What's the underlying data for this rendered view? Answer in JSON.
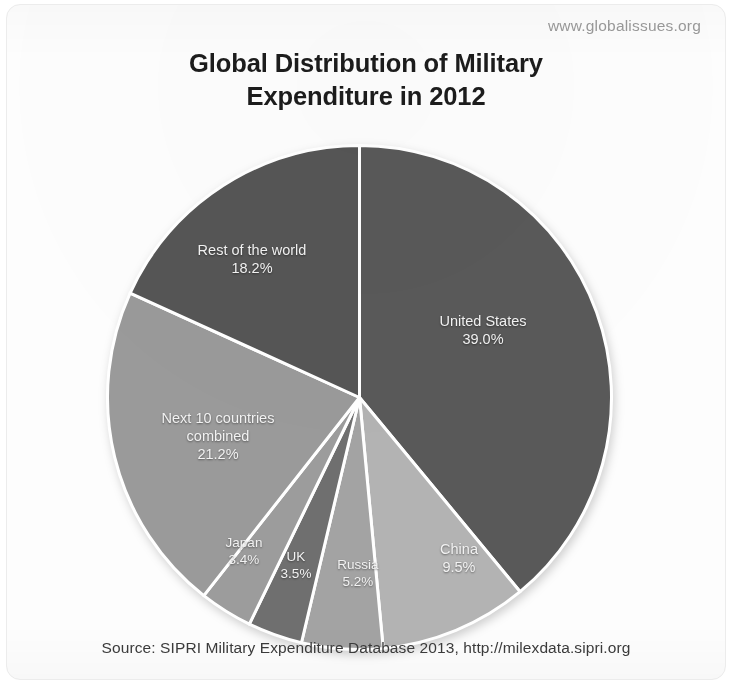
{
  "watermark_url": "www.globalissues.org",
  "title_lines": [
    "Global Distribution of Military",
    "Expenditure in 2012"
  ],
  "source_note": "Source: SIPRI Military Expenditure Database 2013, http://milexdata.sipri.org",
  "chart_data": {
    "type": "pie",
    "title": "Global Distribution of Military Expenditure in 2012",
    "subtitle": "",
    "xlabel": "",
    "ylabel": "",
    "unit": "%",
    "legend_position": "none",
    "labels_inside_slices": true,
    "start_angle_deg": 0,
    "direction": "clockwise",
    "categories": [
      "United States",
      "China",
      "Russia",
      "UK",
      "Japan",
      "Next 10 countries combined",
      "Rest of the world"
    ],
    "values": [
      39.0,
      9.5,
      5.2,
      3.5,
      3.4,
      21.2,
      18.2
    ],
    "value_labels": [
      "39.0%",
      "9.5%",
      "5.2%",
      "3.5%",
      "3.4%",
      "21.2%",
      "18.2%"
    ],
    "colors": [
      "#595959",
      "#b3b3b3",
      "#a3a3a3",
      "#6f6f6f",
      "#9c9c9c",
      "#9a9a9a",
      "#555555"
    ],
    "slices": [
      {
        "name": "United States",
        "value": 39.0,
        "value_label": "39.0%",
        "label_line1": "United States",
        "label_line2": "39.0%",
        "color": "#595959",
        "label_x": 377,
        "label_y": 186
      },
      {
        "name": "China",
        "value": 9.5,
        "value_label": "9.5%",
        "label_line1": "China",
        "label_line2": "9.5%",
        "color": "#b3b3b3",
        "label_x": 353,
        "label_y": 414
      },
      {
        "name": "Russia",
        "value": 5.2,
        "value_label": "5.2%",
        "label_line1": "Russia",
        "label_line2": "5.2%",
        "color": "#a3a3a3",
        "label_x": 252,
        "label_y": 430
      },
      {
        "name": "UK",
        "value": 3.5,
        "value_label": "3.5%",
        "label_line1": "UK",
        "label_line2": "3.5%",
        "color": "#6f6f6f",
        "label_x": 190,
        "label_y": 422
      },
      {
        "name": "Japan",
        "value": 3.4,
        "value_label": "3.4%",
        "label_line1": "Japan",
        "label_line2": "3.4%",
        "color": "#9c9c9c",
        "label_x": 138,
        "label_y": 408
      },
      {
        "name": "Next 10 countries combined",
        "value": 21.2,
        "value_label": "21.2%",
        "label_line1": "Next 10 countries",
        "label_line2": "combined",
        "label_line3": "21.2%",
        "color": "#9a9a9a",
        "label_x": 112,
        "label_y": 292
      },
      {
        "name": "Rest of the world",
        "value": 18.2,
        "value_label": "18.2%",
        "label_line1": "Rest of the world",
        "label_line2": "18.2%",
        "color": "#555555",
        "label_x": 146,
        "label_y": 115
      }
    ]
  }
}
